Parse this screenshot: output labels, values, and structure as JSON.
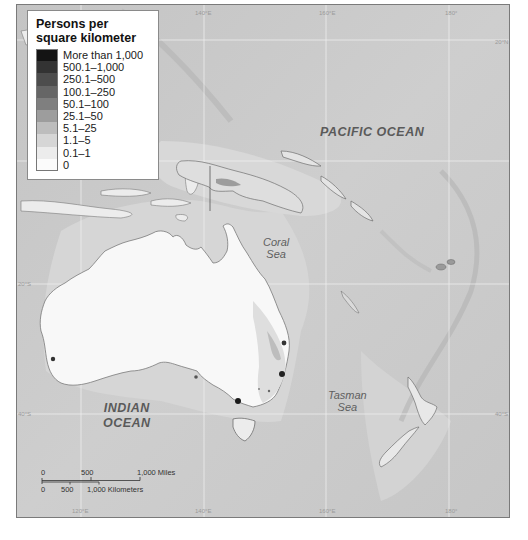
{
  "map": {
    "legend": {
      "title_line1": "Persons per",
      "title_line2": "square kilometer",
      "items": [
        {
          "label": "More than 1,000",
          "color": "#141414"
        },
        {
          "label": "500.1–1,000",
          "color": "#333333"
        },
        {
          "label": "250.1–500",
          "color": "#4d4d4d"
        },
        {
          "label": "100.1–250",
          "color": "#666666"
        },
        {
          "label": "50.1–100",
          "color": "#7f7f7f"
        },
        {
          "label": "25.1–50",
          "color": "#9d9d9d"
        },
        {
          "label": "5.1–25",
          "color": "#bdbdbd"
        },
        {
          "label": "1.1–5",
          "color": "#d6d6d6"
        },
        {
          "label": "0.1–1",
          "color": "#ececec"
        },
        {
          "label": "0",
          "color": "#fbfbfb"
        }
      ]
    },
    "labels": {
      "pacific_ocean": "PACIFIC OCEAN",
      "indian_ocean_line1": "INDIAN",
      "indian_ocean_line2": "OCEAN",
      "coral_sea_line1": "Coral",
      "coral_sea_line2": "Sea",
      "tasman_sea_line1": "Tasman",
      "tasman_sea_line2": "Sea"
    },
    "grid": {
      "longitudes_top": [
        "140°E",
        "160°E",
        "180°"
      ],
      "longitudes_bottom": [
        "120°E",
        "140°E",
        "160°E",
        "180°"
      ],
      "latitudes_left": [
        "20°N",
        "20°S",
        "40°S"
      ],
      "latitudes_right": [
        "20°S",
        "20°S",
        "40°S"
      ]
    },
    "scale_bar": {
      "miles": {
        "zero": "0",
        "mid": "500",
        "end": "1,000 Miles"
      },
      "km": {
        "zero": "0",
        "mid": "500",
        "end": "1,000 Kilometers"
      }
    },
    "colors": {
      "ocean": "#c9c9c9",
      "land_sparse": "#f8f8f8",
      "frame": "#7a7a7a",
      "grid": "#f2f2f2"
    }
  }
}
